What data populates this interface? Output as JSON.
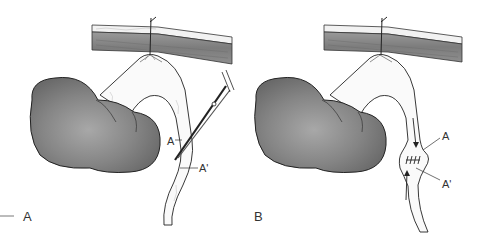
{
  "figure": {
    "colors": {
      "organ_fill": "#7a7a7a",
      "organ_highlight": "#a8a8a8",
      "outline": "#222222",
      "wall_muscle": "#8c8c8c",
      "wall_skin": "#e8e8e8",
      "label_text": "#333333"
    },
    "panels": [
      {
        "id": "A",
        "panel_label": "A",
        "point_labels": [
          "A",
          "A'"
        ],
        "instrument": "scissors"
      },
      {
        "id": "B",
        "panel_label": "B",
        "point_labels": [
          "A",
          "A'"
        ],
        "features": [
          "sutures",
          "flow-arrows"
        ]
      }
    ]
  }
}
